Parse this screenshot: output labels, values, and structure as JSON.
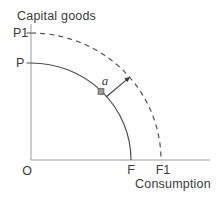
{
  "figure": {
    "type": "production-possibility-frontier-diagram",
    "y_axis_label": "Capital goods",
    "x_axis_label": "Consumption",
    "origin_label": "O",
    "labels": {
      "p1": "P1",
      "p": "P",
      "f": "F",
      "f1": "F1",
      "point_a": "a"
    },
    "curves": [
      {
        "name": "initial-frontier",
        "style": "solid",
        "y_intercept_label": "P",
        "x_intercept_label": "F"
      },
      {
        "name": "shifted-frontier",
        "style": "dashed",
        "y_intercept_label": "P1",
        "x_intercept_label": "F1"
      }
    ],
    "colors": {
      "background": "#ffffff",
      "axis": "#9a9a9a",
      "curve": "#4f4f4f",
      "text": "#3a3a3a",
      "point_fill": "#9c9c9c",
      "point_stroke": "#626262",
      "arrow": "#3f3f3f"
    }
  }
}
